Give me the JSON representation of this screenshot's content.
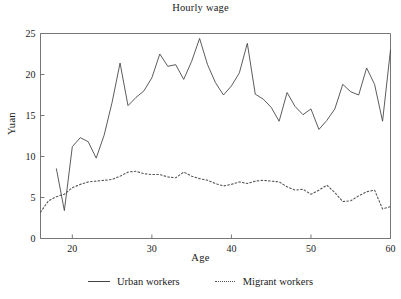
{
  "chart_data": {
    "type": "line",
    "title": "Hourly wage",
    "xlabel": "Age",
    "ylabel": "Yuan",
    "xlim": [
      16,
      60
    ],
    "ylim": [
      0,
      25
    ],
    "xticks": [
      20,
      30,
      40,
      50,
      60
    ],
    "yticks": [
      0,
      5,
      10,
      15,
      20,
      25
    ],
    "grid": false,
    "legend_position": "bottom",
    "colors": {
      "urban": "#4a4a4a",
      "migrant": "#555555",
      "axis": "#777777"
    },
    "series": [
      {
        "name": "Urban workers",
        "style": "solid",
        "x": [
          18,
          19,
          20,
          21,
          22,
          23,
          24,
          25,
          26,
          27,
          28,
          29,
          30,
          31,
          32,
          33,
          34,
          35,
          36,
          37,
          38,
          39,
          40,
          41,
          42,
          43,
          44,
          45,
          46,
          47,
          48,
          49,
          50,
          51,
          52,
          53,
          54,
          55,
          56,
          57,
          58,
          59,
          60
        ],
        "y": [
          8.5,
          3.4,
          11.2,
          12.3,
          11.8,
          9.8,
          12.6,
          16.6,
          21.4,
          16.2,
          17.2,
          18.0,
          19.6,
          22.5,
          21.0,
          21.2,
          19.4,
          21.6,
          24.4,
          21.2,
          19.0,
          17.5,
          18.6,
          20.2,
          23.8,
          17.6,
          17.0,
          16.0,
          14.3,
          17.8,
          16.1,
          15.1,
          15.8,
          13.3,
          14.4,
          15.8,
          18.8,
          17.9,
          17.5,
          20.8,
          18.8,
          14.3,
          23.0
        ]
      },
      {
        "name": "Migrant workers",
        "style": "dotted",
        "x": [
          16,
          17,
          18,
          19,
          20,
          21,
          22,
          23,
          24,
          25,
          26,
          27,
          28,
          29,
          30,
          31,
          32,
          33,
          34,
          35,
          36,
          37,
          38,
          39,
          40,
          41,
          42,
          43,
          44,
          45,
          46,
          47,
          48,
          49,
          50,
          51,
          52,
          53,
          54,
          55,
          56,
          57,
          58,
          59,
          60
        ],
        "y": [
          3.2,
          4.6,
          5.1,
          5.4,
          6.2,
          6.6,
          6.9,
          7.0,
          7.1,
          7.2,
          7.6,
          8.1,
          8.2,
          7.9,
          7.8,
          7.8,
          7.5,
          7.4,
          8.1,
          7.6,
          7.3,
          7.1,
          6.7,
          6.4,
          6.6,
          6.9,
          6.7,
          7.0,
          7.1,
          7.0,
          6.9,
          6.3,
          5.9,
          6.0,
          5.4,
          5.9,
          6.5,
          5.6,
          4.5,
          4.6,
          5.2,
          5.7,
          5.9,
          3.6,
          3.9
        ]
      }
    ]
  },
  "legend": {
    "entries": [
      {
        "label": "Urban workers",
        "style": "solid"
      },
      {
        "label": "Migrant workers",
        "style": "dotted"
      }
    ]
  }
}
